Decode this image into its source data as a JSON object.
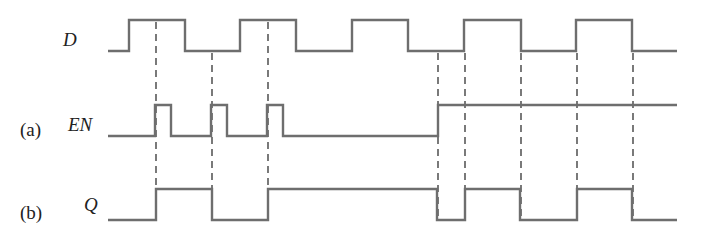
{
  "diagram": {
    "colors": {
      "waveform": "#6e6e6e",
      "dashed_guides": "#333333",
      "text": "#222222",
      "background": "#ffffff"
    },
    "signals": [
      {
        "id": "D",
        "label": "D",
        "prefix": "",
        "high_y": 20,
        "low_y": 51,
        "start_x": 108,
        "end_x": 677,
        "initial": 0,
        "transitions": [
          129,
          185,
          240,
          296,
          352,
          408,
          464,
          521,
          576,
          632
        ]
      },
      {
        "id": "EN",
        "label": "EN",
        "prefix": "(a)",
        "high_y": 105,
        "low_y": 136,
        "start_x": 108,
        "end_x": 677,
        "initial": 0,
        "transitions": [
          155,
          171,
          211,
          227,
          267,
          283,
          438
        ]
      },
      {
        "id": "Q",
        "label": "Q",
        "prefix": "(b)",
        "high_y": 189,
        "low_y": 220,
        "start_x": 108,
        "end_x": 677,
        "initial": 0,
        "transitions": [
          156,
          212,
          268,
          437,
          465,
          520,
          577,
          632
        ]
      }
    ],
    "guides": [
      {
        "x": 156,
        "y1": 22,
        "y2": 220
      },
      {
        "x": 212,
        "y1": 53,
        "y2": 220
      },
      {
        "x": 268,
        "y1": 22,
        "y2": 220
      },
      {
        "x": 438,
        "y1": 53,
        "y2": 220
      },
      {
        "x": 465,
        "y1": 53,
        "y2": 220
      },
      {
        "x": 521,
        "y1": 53,
        "y2": 220
      },
      {
        "x": 577,
        "y1": 53,
        "y2": 220
      },
      {
        "x": 633,
        "y1": 53,
        "y2": 220
      }
    ],
    "labels": {
      "d": "D",
      "en_prefix": "(a)",
      "en": "EN",
      "q_prefix": "(b)",
      "q": "Q"
    }
  }
}
